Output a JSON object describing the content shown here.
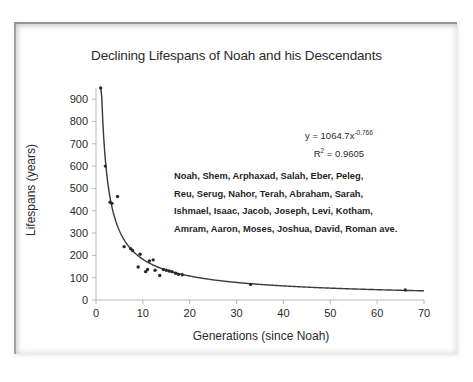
{
  "chart_data": {
    "type": "scatter",
    "title": "Declining Lifespans of Noah and his Descendants",
    "xlabel": "Generations (since Noah)",
    "ylabel": "Lifespans (years)",
    "xlim": [
      0,
      70
    ],
    "ylim": [
      0,
      950
    ],
    "xticks": [
      0,
      10,
      20,
      30,
      40,
      50,
      60,
      70
    ],
    "yticks": [
      0,
      100,
      200,
      300,
      400,
      500,
      600,
      700,
      800,
      900
    ],
    "grid": false,
    "legend": "none",
    "series": [
      {
        "name": "Lifespans",
        "points": [
          {
            "x": 1,
            "y": 950
          },
          {
            "x": 2,
            "y": 600
          },
          {
            "x": 3,
            "y": 438
          },
          {
            "x": 3.4,
            "y": 433
          },
          {
            "x": 4.6,
            "y": 464
          },
          {
            "x": 6,
            "y": 239
          },
          {
            "x": 7.4,
            "y": 230
          },
          {
            "x": 7.8,
            "y": 222
          },
          {
            "x": 9,
            "y": 148
          },
          {
            "x": 9.4,
            "y": 205
          },
          {
            "x": 10.6,
            "y": 127
          },
          {
            "x": 11,
            "y": 137
          },
          {
            "x": 11.4,
            "y": 175
          },
          {
            "x": 12.2,
            "y": 180
          },
          {
            "x": 12.6,
            "y": 133
          },
          {
            "x": 13.6,
            "y": 110
          },
          {
            "x": 14.4,
            "y": 137
          },
          {
            "x": 15,
            "y": 133
          },
          {
            "x": 15.6,
            "y": 130
          },
          {
            "x": 16.2,
            "y": 127
          },
          {
            "x": 17,
            "y": 120
          },
          {
            "x": 17.6,
            "y": 115
          },
          {
            "x": 18.4,
            "y": 113
          },
          {
            "x": 33,
            "y": 70
          },
          {
            "x": 66,
            "y": 45
          }
        ]
      }
    ],
    "fit": {
      "type": "power",
      "coefficient": 1064.7,
      "exponent": -0.766,
      "equation_prefix": "y = 1064.7x",
      "equation_exponent": "-0.766",
      "r_squared_label": "R",
      "r_squared_sup": "2",
      "r_squared_value": " = 0.9605"
    },
    "annotation_names": [
      "Noah, Shem, Arphaxad, Salah, Eber, Peleg,",
      "Reu, Serug, Nahor, Terah, Abraham, Sarah,",
      "Ishmael, Isaac, Jacob, Joseph, Levi, Kotham,",
      "Amram, Aaron, Moses, Joshua, David, Roman ave."
    ],
    "colors": {
      "point": "#2a2a2a",
      "curve": "#3a3a3a",
      "axis": "#b9b9b9",
      "text": "#2b2b2b",
      "background": "#ffffff"
    }
  }
}
